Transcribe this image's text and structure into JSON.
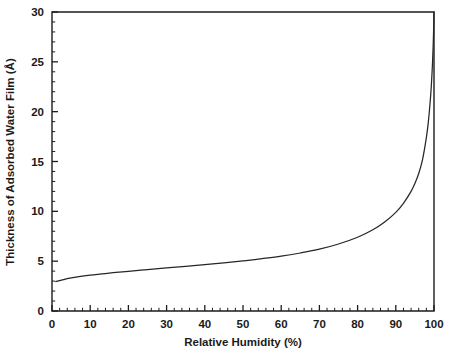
{
  "chart_data": {
    "type": "line",
    "title": "",
    "xlabel": "Relative Humidity (%)",
    "ylabel": "Thickness of Adsorbed Water Film (Å)",
    "xlim": [
      0,
      100
    ],
    "ylim": [
      0,
      30
    ],
    "grid": false,
    "legend": "none",
    "x_ticks": [
      0,
      10,
      20,
      30,
      40,
      50,
      60,
      70,
      80,
      90,
      100
    ],
    "x_tick_labels": [
      "0",
      "10",
      "20",
      "30",
      "40",
      "50",
      "60",
      "70",
      "80",
      "90",
      "100"
    ],
    "x_minor_interval": 2,
    "y_ticks": [
      0,
      5,
      10,
      15,
      20,
      25,
      30
    ],
    "y_tick_labels": [
      "0",
      "5",
      "10",
      "15",
      "20",
      "25",
      "30"
    ],
    "y_minor_interval": 1,
    "series": [
      {
        "name": "Adsorbed water film thickness",
        "color": "#262626",
        "x": [
          1,
          2,
          3,
          4,
          5,
          7,
          10,
          13,
          16,
          20,
          25,
          30,
          35,
          40,
          45,
          50,
          55,
          60,
          65,
          70,
          75,
          80,
          84,
          87,
          90,
          92,
          94,
          95,
          96,
          97,
          98,
          98.5,
          99,
          99.3,
          99.6,
          99.8,
          99.9,
          100
        ],
        "y": [
          2.95,
          3.05,
          3.15,
          3.25,
          3.32,
          3.45,
          3.6,
          3.72,
          3.84,
          3.98,
          4.15,
          4.32,
          4.48,
          4.65,
          4.83,
          5.02,
          5.25,
          5.5,
          5.82,
          6.2,
          6.72,
          7.4,
          8.15,
          8.9,
          9.9,
          10.8,
          12.0,
          12.8,
          13.8,
          15.2,
          17.4,
          18.9,
          21.0,
          22.6,
          24.8,
          26.8,
          28.2,
          30.0
        ]
      }
    ]
  },
  "axis": {
    "x_title": "Relative Humidity (%)",
    "y_title": "Thickness of Adsorbed Water Film (Å)"
  },
  "colors": {
    "curve": "#262626",
    "frame": "#1d1d1d",
    "text": "#1a1a1a",
    "background": "#ffffff"
  }
}
